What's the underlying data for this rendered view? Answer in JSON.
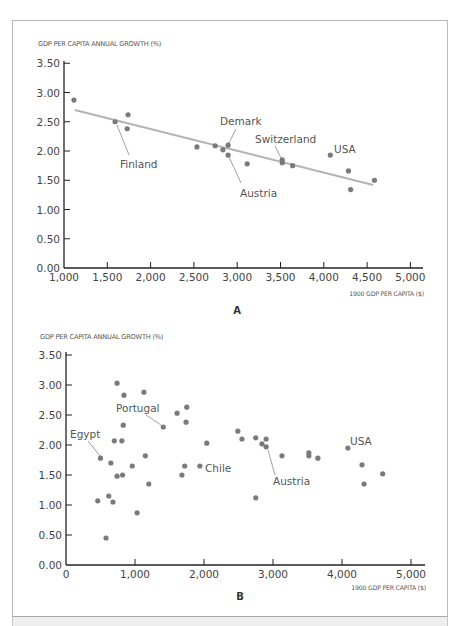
{
  "figure": {
    "panels": [
      {
        "id": "A",
        "label": "A"
      },
      {
        "id": "B",
        "label": "B"
      }
    ]
  },
  "chart_data": [
    {
      "type": "scatter",
      "panel": "A",
      "title": "",
      "ylabel": "GDP PER CAPITA ANNUAL GROWTH (%)",
      "xlabel": "1900 GDP PER CAPITA ($)",
      "xlim": [
        1000,
        5000
      ],
      "ylim": [
        0,
        3.5
      ],
      "xticks": [
        "1,000",
        "1,500",
        "2,000",
        "2,500",
        "3,000",
        "3,500",
        "4,000",
        "4,500",
        "5,000"
      ],
      "xtick_values": [
        1000,
        1500,
        2000,
        2500,
        3000,
        3500,
        4000,
        4500,
        5000
      ],
      "yticks": [
        "0.00",
        "0.50",
        "1.00",
        "1.50",
        "2.00",
        "2.50",
        "3.00",
        "3.50"
      ],
      "ytick_values": [
        0,
        0.5,
        1.0,
        1.5,
        2.0,
        2.5,
        3.0,
        3.5
      ],
      "grid": false,
      "points": [
        {
          "x": 1115,
          "y": 2.87
        },
        {
          "x": 1590,
          "y": 2.5,
          "label": "Finland"
        },
        {
          "x": 1740,
          "y": 2.62
        },
        {
          "x": 1730,
          "y": 2.38
        },
        {
          "x": 2535,
          "y": 2.07
        },
        {
          "x": 2745,
          "y": 2.09
        },
        {
          "x": 2835,
          "y": 2.02
        },
        {
          "x": 2895,
          "y": 2.1,
          "label": "Demark"
        },
        {
          "x": 2895,
          "y": 1.93,
          "label": "Austria"
        },
        {
          "x": 3115,
          "y": 1.78
        },
        {
          "x": 3520,
          "y": 1.85,
          "label": "Switzerland"
        },
        {
          "x": 3520,
          "y": 1.8
        },
        {
          "x": 3640,
          "y": 1.75
        },
        {
          "x": 4075,
          "y": 1.93,
          "label": "USA"
        },
        {
          "x": 4285,
          "y": 1.66
        },
        {
          "x": 4310,
          "y": 1.34
        },
        {
          "x": 4585,
          "y": 1.5
        }
      ],
      "trendline": {
        "x1": 1125,
        "y1": 2.7,
        "x2": 4570,
        "y2": 1.42
      },
      "annotations": [
        {
          "text": "Finland",
          "point_index": 1
        },
        {
          "text": "Demark",
          "point_index": 7
        },
        {
          "text": "Austria",
          "point_index": 8
        },
        {
          "text": "Switzerland",
          "point_index": 10
        },
        {
          "text": "USA",
          "point_index": 13
        }
      ]
    },
    {
      "type": "scatter",
      "panel": "B",
      "title": "",
      "ylabel": "GDP PER CAPITA ANNUAL GROWTH (%)",
      "xlabel": "1900 GDP PER CAPITA ($)",
      "xlim": [
        0,
        5000
      ],
      "ylim": [
        0,
        3.5
      ],
      "xticks": [
        "0",
        "1,000",
        "2,000",
        "3,000",
        "4,000",
        "5,000"
      ],
      "xtick_values": [
        0,
        1000,
        2000,
        3000,
        4000,
        5000
      ],
      "yticks": [
        "0.00",
        "0.50",
        "1.00",
        "1.50",
        "2.00",
        "2.50",
        "3.00",
        "3.50"
      ],
      "ytick_values": [
        0,
        0.5,
        1.0,
        1.5,
        2.0,
        2.5,
        3.0,
        3.5
      ],
      "grid": false,
      "points": [
        {
          "x": 740,
          "y": 3.03
        },
        {
          "x": 840,
          "y": 2.83
        },
        {
          "x": 1130,
          "y": 2.88
        },
        {
          "x": 1410,
          "y": 2.3,
          "label": "Portugal"
        },
        {
          "x": 830,
          "y": 2.33
        },
        {
          "x": 700,
          "y": 2.07
        },
        {
          "x": 810,
          "y": 2.07
        },
        {
          "x": 500,
          "y": 1.78,
          "label": "Egypt"
        },
        {
          "x": 650,
          "y": 1.7
        },
        {
          "x": 1150,
          "y": 1.82
        },
        {
          "x": 960,
          "y": 1.65
        },
        {
          "x": 740,
          "y": 1.48
        },
        {
          "x": 820,
          "y": 1.5
        },
        {
          "x": 1200,
          "y": 1.35
        },
        {
          "x": 460,
          "y": 1.07
        },
        {
          "x": 620,
          "y": 1.15
        },
        {
          "x": 680,
          "y": 1.05
        },
        {
          "x": 1030,
          "y": 0.87
        },
        {
          "x": 580,
          "y": 0.45
        },
        {
          "x": 1610,
          "y": 2.53
        },
        {
          "x": 1750,
          "y": 2.63
        },
        {
          "x": 1740,
          "y": 2.38
        },
        {
          "x": 2040,
          "y": 2.03
        },
        {
          "x": 1720,
          "y": 1.65
        },
        {
          "x": 1680,
          "y": 1.5
        },
        {
          "x": 1940,
          "y": 1.65,
          "label": "Chile"
        },
        {
          "x": 2490,
          "y": 2.23
        },
        {
          "x": 2550,
          "y": 2.1
        },
        {
          "x": 2750,
          "y": 2.12
        },
        {
          "x": 2900,
          "y": 2.1
        },
        {
          "x": 2840,
          "y": 2.02
        },
        {
          "x": 2900,
          "y": 1.97,
          "label": "Austria"
        },
        {
          "x": 3130,
          "y": 1.82
        },
        {
          "x": 3520,
          "y": 1.87
        },
        {
          "x": 3520,
          "y": 1.82
        },
        {
          "x": 3650,
          "y": 1.78
        },
        {
          "x": 4085,
          "y": 1.95,
          "label": "USA"
        },
        {
          "x": 4290,
          "y": 1.67
        },
        {
          "x": 4320,
          "y": 1.35
        },
        {
          "x": 4590,
          "y": 1.52
        },
        {
          "x": 2750,
          "y": 1.12
        }
      ],
      "annotations": [
        {
          "text": "Portugal",
          "point_index": 3
        },
        {
          "text": "Egypt",
          "point_index": 7
        },
        {
          "text": "Chile",
          "point_index": 25
        },
        {
          "text": "Austria",
          "point_index": 31
        },
        {
          "text": "USA",
          "point_index": 36
        }
      ]
    }
  ],
  "style": {
    "point_color": "#7a7a7a",
    "trend_color": "#b3b3b3",
    "axis_color": "#222222",
    "leader_color": "#777777"
  }
}
